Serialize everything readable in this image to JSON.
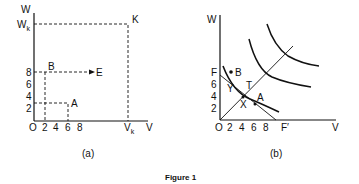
{
  "figure": {
    "caption": "Figure 1",
    "panel_a": {
      "label": "(a)",
      "y_axis": "W",
      "x_axis": "V",
      "origin": "O",
      "x_ticks": [
        "2",
        "4",
        "6",
        "8"
      ],
      "y_ticks": [
        "2",
        "4",
        "6",
        "8"
      ],
      "wk_main": "W",
      "wk_sub": "k",
      "vk_main": "V",
      "vk_sub": "k",
      "points": {
        "a": "A",
        "b": "B",
        "e": "E",
        "k": "K"
      }
    },
    "panel_b": {
      "label": "(b)",
      "y_axis": "W",
      "x_axis": "V",
      "origin": "O",
      "x_ticks": [
        "2",
        "4",
        "6",
        "8"
      ],
      "y_ticks": [
        "2",
        "4",
        "6"
      ],
      "f_label": "F",
      "f_prime_label": "F′",
      "points": {
        "b": "B",
        "y": "Y",
        "t": "T",
        "x": "X",
        "a": "A"
      }
    }
  }
}
